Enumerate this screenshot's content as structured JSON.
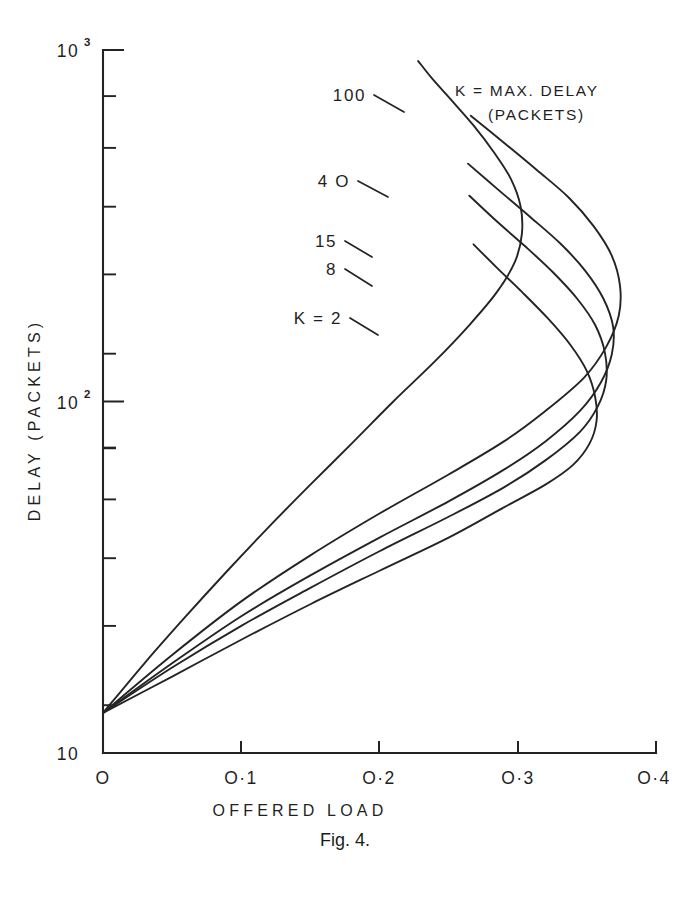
{
  "figure": {
    "caption": "Fig. 4.",
    "caption_top": 830
  },
  "legend": {
    "line1": "K = MAX. DELAY",
    "line2": "(PACKETS)"
  },
  "axes": {
    "y_title": "DELAY (PACKETS)",
    "x_title": "OFFERED  LOAD",
    "y_tick_labels": [
      "10",
      "10",
      "10"
    ],
    "y_tick_exponents": [
      "3",
      "2",
      ""
    ],
    "x_tick_labels": [
      "O",
      "O·1",
      "O·2",
      "O·3",
      "O·4"
    ]
  },
  "curve_labels": [
    {
      "text": "100"
    },
    {
      "text": "4 O"
    },
    {
      "text": "15"
    },
    {
      "text": "8"
    },
    {
      "text": "K = 2"
    }
  ],
  "chart_data": {
    "type": "line",
    "title": "Fig. 4.",
    "xlabel": "OFFERED LOAD",
    "ylabel": "DELAY (PACKETS)",
    "xlim": [
      0,
      0.4
    ],
    "ylim": [
      10,
      1000
    ],
    "yscale": "log",
    "xscale": "linear",
    "grid": false,
    "legend_position": "upper-right",
    "legend_title": "K = MAX. DELAY (PACKETS)",
    "xticks": [
      0,
      0.1,
      0.2,
      0.3,
      0.4
    ],
    "xticklabels": [
      "O",
      "O·1",
      "O·2",
      "O·3",
      "O·4"
    ],
    "yticks": [
      10,
      100,
      1000
    ],
    "yticklabels": [
      "10",
      "10²",
      "10³"
    ],
    "y_minor_ticks": [
      20,
      30,
      40,
      50,
      60,
      70,
      80,
      90,
      200,
      300,
      400,
      500,
      600,
      700,
      800,
      900
    ],
    "note": "Each curve is back-bending (S-shaped): delay rises with offered load up to a maximum-throughput nose, then folds back to lower load at higher delay.",
    "series": [
      {
        "name": "K = 2",
        "k": 2,
        "label": "K = 2",
        "points": [
          [
            0.0,
            13.0
          ],
          [
            0.05,
            16.5
          ],
          [
            0.1,
            21.0
          ],
          [
            0.15,
            26.5
          ],
          [
            0.2,
            33.0
          ],
          [
            0.25,
            41.0
          ],
          [
            0.29,
            50.0
          ],
          [
            0.32,
            58.0
          ],
          [
            0.34,
            66.0
          ],
          [
            0.352,
            76.0
          ],
          [
            0.357,
            88.0
          ],
          [
            0.356,
            103.0
          ],
          [
            0.35,
            122.0
          ],
          [
            0.338,
            145.0
          ],
          [
            0.322,
            172.0
          ],
          [
            0.303,
            205.0
          ],
          [
            0.285,
            240.0
          ],
          [
            0.268,
            280.0
          ]
        ]
      },
      {
        "name": "8",
        "k": 8,
        "label": "8",
        "points": [
          [
            0.0,
            13.0
          ],
          [
            0.05,
            17.5
          ],
          [
            0.1,
            23.0
          ],
          [
            0.15,
            29.5
          ],
          [
            0.2,
            37.5
          ],
          [
            0.25,
            47.0
          ],
          [
            0.29,
            57.0
          ],
          [
            0.32,
            68.0
          ],
          [
            0.345,
            82.0
          ],
          [
            0.358,
            97.0
          ],
          [
            0.364,
            115.0
          ],
          [
            0.363,
            138.0
          ],
          [
            0.356,
            165.0
          ],
          [
            0.343,
            196.0
          ],
          [
            0.326,
            232.0
          ],
          [
            0.306,
            275.0
          ],
          [
            0.285,
            325.0
          ],
          [
            0.265,
            385.0
          ]
        ]
      },
      {
        "name": "15",
        "k": 15,
        "label": "15",
        "points": [
          [
            0.0,
            13.0
          ],
          [
            0.05,
            18.0
          ],
          [
            0.1,
            24.5
          ],
          [
            0.15,
            32.0
          ],
          [
            0.2,
            41.0
          ],
          [
            0.25,
            52.0
          ],
          [
            0.29,
            64.0
          ],
          [
            0.32,
            77.0
          ],
          [
            0.345,
            94.0
          ],
          [
            0.36,
            113.0
          ],
          [
            0.368,
            136.0
          ],
          [
            0.369,
            163.0
          ],
          [
            0.362,
            196.0
          ],
          [
            0.349,
            235.0
          ],
          [
            0.331,
            281.0
          ],
          [
            0.309,
            335.0
          ],
          [
            0.286,
            400.0
          ],
          [
            0.264,
            475.0
          ]
        ]
      },
      {
        "name": "4 O",
        "k": 40,
        "label": "4 O",
        "points": [
          [
            0.0,
            13.0
          ],
          [
            0.05,
            19.0
          ],
          [
            0.1,
            27.0
          ],
          [
            0.15,
            36.5
          ],
          [
            0.2,
            48.0
          ],
          [
            0.25,
            62.0
          ],
          [
            0.29,
            77.0
          ],
          [
            0.32,
            94.0
          ],
          [
            0.348,
            117.0
          ],
          [
            0.364,
            143.0
          ],
          [
            0.373,
            175.0
          ],
          [
            0.374,
            213.0
          ],
          [
            0.368,
            260.0
          ],
          [
            0.355,
            315.0
          ],
          [
            0.337,
            380.0
          ],
          [
            0.314,
            455.0
          ],
          [
            0.29,
            545.0
          ],
          [
            0.266,
            650.0
          ]
        ]
      },
      {
        "name": "100",
        "k": 100,
        "label": "100",
        "points": [
          [
            0.0,
            13.0
          ],
          [
            0.03,
            18.0
          ],
          [
            0.06,
            24.5
          ],
          [
            0.09,
            33.0
          ],
          [
            0.12,
            44.0
          ],
          [
            0.15,
            58.0
          ],
          [
            0.18,
            76.0
          ],
          [
            0.21,
            100.0
          ],
          [
            0.24,
            130.0
          ],
          [
            0.265,
            165.0
          ],
          [
            0.285,
            205.0
          ],
          [
            0.298,
            250.0
          ],
          [
            0.303,
            300.0
          ],
          [
            0.302,
            360.0
          ],
          [
            0.295,
            430.0
          ],
          [
            0.283,
            510.0
          ],
          [
            0.268,
            610.0
          ],
          [
            0.252,
            720.0
          ],
          [
            0.238,
            830.0
          ],
          [
            0.228,
            930.0
          ]
        ]
      }
    ]
  }
}
